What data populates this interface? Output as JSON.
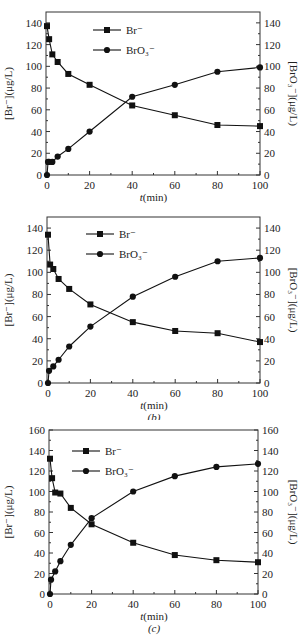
{
  "chart_data": [
    {
      "type": "line",
      "panel": "a",
      "caption": "(a)",
      "xlabel_italic": "t",
      "xlabel_rest": "(min)",
      "ylabel_left": "[Br⁻](μg/L)",
      "ylabel_right": "[BrO₃⁻](μg/L)",
      "xlim": [
        0,
        100
      ],
      "ylim": [
        0,
        150
      ],
      "xticks": [
        0,
        20,
        40,
        60,
        80,
        100
      ],
      "yticks": [
        0,
        20,
        40,
        60,
        80,
        100,
        120,
        140
      ],
      "legend": [
        "Br⁻",
        "BrO₃⁻"
      ],
      "legend_position": "upper-center",
      "grid": false,
      "series": [
        {
          "name": "Br⁻",
          "marker": "square",
          "x": [
            0,
            1,
            2.5,
            5,
            10,
            20,
            40,
            60,
            80,
            100
          ],
          "values": [
            137,
            125,
            111,
            104,
            93,
            83,
            64,
            55,
            46,
            45
          ]
        },
        {
          "name": "BrO₃⁻",
          "marker": "circle",
          "x": [
            0,
            0.5,
            1,
            2.5,
            5,
            10,
            20,
            40,
            60,
            80,
            100
          ],
          "values": [
            0,
            12,
            12,
            12,
            17,
            24,
            40,
            72,
            83,
            95,
            99
          ]
        }
      ]
    },
    {
      "type": "line",
      "panel": "b",
      "caption": "(b)",
      "xlabel_italic": "t",
      "xlabel_rest": "(min)",
      "ylabel_left": "[Br⁻](μg/L)",
      "ylabel_right": "[BrO₃⁻](μg/L)",
      "xlim": [
        0,
        100
      ],
      "ylim": [
        0,
        150
      ],
      "xticks": [
        0,
        20,
        40,
        60,
        80,
        100
      ],
      "yticks": [
        0,
        20,
        40,
        60,
        80,
        100,
        120,
        140
      ],
      "legend": [
        "Br⁻",
        "BrO₃⁻"
      ],
      "legend_position": "upper-center",
      "grid": false,
      "series": [
        {
          "name": "Br⁻",
          "marker": "square",
          "x": [
            0,
            1,
            2.5,
            5,
            10,
            20,
            40,
            60,
            80,
            100
          ],
          "values": [
            134,
            107,
            103,
            94,
            85,
            71,
            55,
            47,
            45,
            37
          ]
        },
        {
          "name": "BrO₃⁻",
          "marker": "circle",
          "x": [
            0,
            0.5,
            2.5,
            5,
            10,
            20,
            40,
            60,
            80,
            100
          ],
          "values": [
            0,
            11,
            15,
            21,
            33,
            51,
            78,
            96,
            110,
            113
          ]
        }
      ]
    },
    {
      "type": "line",
      "panel": "c",
      "caption": "(c)",
      "xlabel_italic": "t",
      "xlabel_rest": "(min)",
      "ylabel_left": "[Br⁻](μg/L)",
      "ylabel_right": "[BrO₃⁻](μg/L)",
      "xlim": [
        0,
        100
      ],
      "ylim": [
        0,
        160
      ],
      "xticks": [
        0,
        20,
        40,
        60,
        80,
        100
      ],
      "yticks": [
        0,
        20,
        40,
        60,
        80,
        100,
        120,
        140,
        160
      ],
      "legend": [
        "Br⁻",
        "BrO₃⁻"
      ],
      "legend_position": "upper-left",
      "grid": false,
      "series": [
        {
          "name": "Br⁻",
          "marker": "square",
          "x": [
            0,
            1,
            2.5,
            5,
            10,
            20,
            40,
            60,
            80,
            100
          ],
          "values": [
            132,
            113,
            99,
            98,
            84,
            68,
            50,
            38,
            33,
            31
          ]
        },
        {
          "name": "BrO₃⁻",
          "marker": "circle",
          "x": [
            0,
            0.5,
            2.5,
            5,
            10,
            20,
            40,
            60,
            80,
            100
          ],
          "values": [
            0,
            14,
            22,
            32,
            48,
            74,
            100,
            115,
            124,
            127
          ]
        }
      ]
    }
  ],
  "layout": [
    {
      "top": 0,
      "height": 205,
      "px0": 47,
      "px1": 260,
      "py0": 175,
      "pyTop": 12,
      "legend": {
        "x": 93,
        "y": 30,
        "dy": 20
      }
    },
    {
      "top": 205,
      "height": 215,
      "px0": 48,
      "px1": 260,
      "py0": 178,
      "pyTop": 12,
      "legend": {
        "x": 86,
        "y": 29,
        "dy": 20
      }
    },
    {
      "top": 420,
      "height": 221,
      "px0": 50,
      "px1": 258,
      "py0": 174,
      "pyTop": 10,
      "legend": {
        "x": 72,
        "y": 31,
        "dy": 20
      }
    }
  ]
}
